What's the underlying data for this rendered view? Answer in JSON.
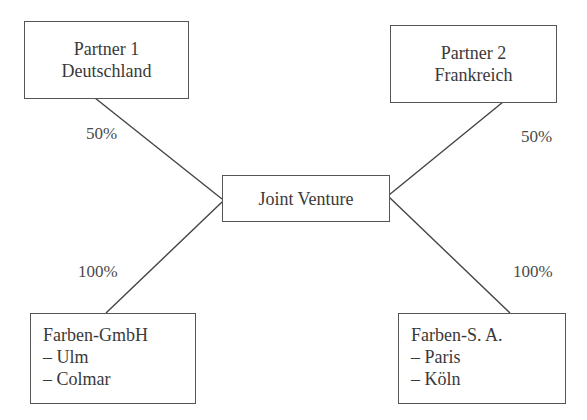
{
  "diagram": {
    "type": "ownership-structure",
    "nodes": {
      "partner1": {
        "lines": [
          "Partner 1",
          "Deutschland"
        ]
      },
      "partner2": {
        "lines": [
          "Partner 2",
          "Frankreich"
        ]
      },
      "joint_venture": {
        "lines": [
          "Joint Venture"
        ]
      },
      "subsidiary_de": {
        "lines": [
          "Farben-GmbH",
          "– Ulm",
          "– Colmar"
        ]
      },
      "subsidiary_fr": {
        "lines": [
          "Farben-S. A.",
          "– Paris",
          "– Köln"
        ]
      }
    },
    "edges": [
      {
        "from": "partner1",
        "to": "joint_venture",
        "label": "50%"
      },
      {
        "from": "partner2",
        "to": "joint_venture",
        "label": "50%"
      },
      {
        "from": "joint_venture",
        "to": "subsidiary_de",
        "label": "100%"
      },
      {
        "from": "joint_venture",
        "to": "subsidiary_fr",
        "label": "100%"
      }
    ],
    "colors": {
      "line": "#444444",
      "box_border": "#555555",
      "text": "#3a3a3a",
      "background": "#ffffff"
    }
  }
}
